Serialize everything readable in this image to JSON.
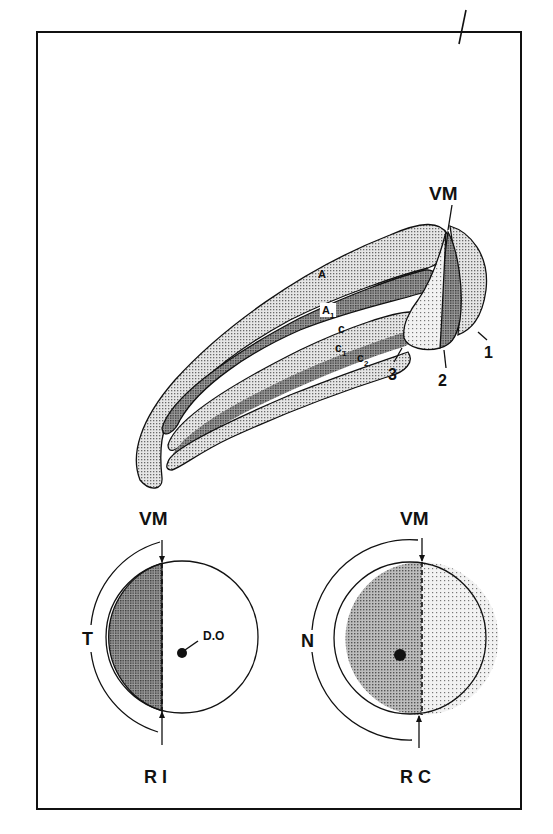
{
  "figure": {
    "top_diagram": {
      "labels": {
        "vm": "VM",
        "a": "A",
        "a1_main": "A",
        "a1_sub": "1",
        "c": "c",
        "c1_main": "c",
        "c1_sub": "1",
        "c2_main": "c",
        "c2_sub": "2",
        "n1": "1",
        "n2": "2",
        "n3": "3"
      }
    },
    "left_circle": {
      "vm": "VM",
      "side": "T",
      "marker": "D.O",
      "caption": "R I"
    },
    "right_circle": {
      "vm": "VM",
      "side": "N",
      "caption": "R C"
    },
    "colors": {
      "light_stipple": "#cfcfcf",
      "dark_stipple": "#8e8e8e",
      "medium_stipple": "#b4b4b4",
      "fine_dots": "#e2e2e2",
      "line": "#111111"
    }
  }
}
